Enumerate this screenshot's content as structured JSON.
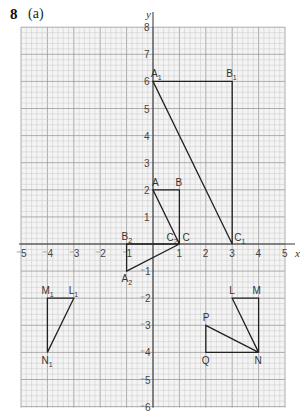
{
  "header": {
    "question_number": "8",
    "part": "(a)"
  },
  "chart_data": {
    "type": "scatter",
    "title": "",
    "xlabel": "x",
    "ylabel": "y",
    "xlim": [
      -5,
      5
    ],
    "ylim": [
      -6,
      8
    ],
    "grid": true,
    "x_ticks": [
      "-5",
      "-4",
      "-3",
      "-2",
      "-1",
      "1",
      "2",
      "3",
      "4",
      "5"
    ],
    "y_ticks": [
      "8",
      "7",
      "6",
      "5",
      "4",
      "3",
      "2",
      "1",
      "-1",
      "-2",
      "-3",
      "-4",
      "-5",
      "-6"
    ],
    "shapes": [
      {
        "name": "ABC",
        "points": [
          {
            "label": "A",
            "x": 0,
            "y": 2
          },
          {
            "label": "B",
            "x": 1,
            "y": 2
          },
          {
            "label": "C",
            "x": 1,
            "y": 0
          }
        ]
      },
      {
        "name": "A1B1C1",
        "points": [
          {
            "label": "A1",
            "x": 0,
            "y": 6
          },
          {
            "label": "B1",
            "x": 3,
            "y": 6
          },
          {
            "label": "C1",
            "x": 3,
            "y": 0
          }
        ]
      },
      {
        "name": "A2B2C2",
        "points": [
          {
            "label": "A2",
            "x": -1,
            "y": -1
          },
          {
            "label": "B2",
            "x": -1,
            "y": 0
          },
          {
            "label": "C2",
            "x": 1,
            "y": 0
          }
        ]
      },
      {
        "name": "LMN",
        "points": [
          {
            "label": "L",
            "x": 3,
            "y": -2
          },
          {
            "label": "M",
            "x": 4,
            "y": -2
          },
          {
            "label": "N",
            "x": 4,
            "y": -4
          }
        ]
      },
      {
        "name": "PQN",
        "points": [
          {
            "label": "P",
            "x": 2,
            "y": -3
          },
          {
            "label": "Q",
            "x": 2,
            "y": -4
          },
          {
            "label": "N",
            "x": 4,
            "y": -4
          }
        ]
      },
      {
        "name": "L1M1N1",
        "points": [
          {
            "label": "L1",
            "x": -3,
            "y": -2
          },
          {
            "label": "M1",
            "x": -4,
            "y": -2
          },
          {
            "label": "N1",
            "x": -4,
            "y": -4
          }
        ]
      }
    ]
  },
  "labels": {
    "A": "A",
    "B": "B",
    "C": "C",
    "A1": "A",
    "B1": "B",
    "C1": "C",
    "A2": "A",
    "B2": "B",
    "C2": "C",
    "L": "L",
    "M": "M",
    "N": "N",
    "P": "P",
    "Q": "Q",
    "L1": "L",
    "M1": "M",
    "N1": "N",
    "sub1": "1",
    "sub2": "2"
  }
}
